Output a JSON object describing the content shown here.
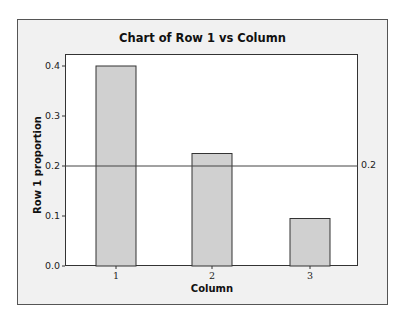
{
  "chart_data": {
    "type": "bar",
    "title": "Chart of Row 1 vs Column",
    "xlabel": "Column",
    "ylabel": "Row 1 proportion",
    "categories": [
      "1",
      "2",
      "3"
    ],
    "values": [
      0.4,
      0.225,
      0.095
    ],
    "ylim": [
      0.0,
      0.42
    ],
    "yticks": [
      "0.0",
      "0.1",
      "0.2",
      "0.3",
      "0.4"
    ],
    "grid": false,
    "legend": null,
    "reference_line": {
      "y": 0.2,
      "label": "0.2"
    },
    "colors": {
      "bar_fill": "#d0d0d0",
      "bar_edge": "#333333",
      "frame_bg": "#f1f1f1",
      "plot_bg": "#ffffff"
    }
  }
}
